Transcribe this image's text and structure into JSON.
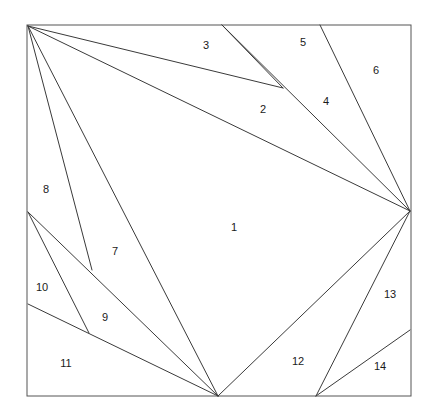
{
  "figure": {
    "background_color": "#ffffff",
    "line_color": "#3a3a3a",
    "border_color": "#555555",
    "label_color": "#1a1a1a",
    "line_width": 1,
    "canvas": {
      "width": 439,
      "height": 420
    }
  },
  "border": {
    "name": "outer-rectangle",
    "x": 27,
    "y": 25,
    "width": 384,
    "height": 371,
    "corners": [
      {
        "name": "top-left",
        "x": 27,
        "y": 25
      },
      {
        "name": "top-right",
        "x": 411,
        "y": 25
      },
      {
        "name": "bottom-right",
        "x": 411,
        "y": 396
      },
      {
        "name": "bottom-left",
        "x": 27,
        "y": 396
      }
    ]
  },
  "vertices": [
    {
      "id": "A",
      "name": "top-left-hub",
      "x": 28,
      "y": 26
    },
    {
      "id": "B",
      "name": "top-edge-node-1",
      "x": 222,
      "y": 25
    },
    {
      "id": "C",
      "name": "top-edge-node-2",
      "x": 320,
      "y": 25
    },
    {
      "id": "D",
      "name": "right-hub",
      "x": 410,
      "y": 211
    },
    {
      "id": "E",
      "name": "interior-node-upper",
      "x": 283,
      "y": 88
    },
    {
      "id": "F",
      "name": "left-edge-node-1",
      "x": 28,
      "y": 212
    },
    {
      "id": "G",
      "name": "left-edge-node-2",
      "x": 28,
      "y": 304
    },
    {
      "id": "H",
      "name": "interior-node-left-upper",
      "x": 92,
      "y": 270
    },
    {
      "id": "I",
      "name": "interior-node-left-lower",
      "x": 89,
      "y": 333
    },
    {
      "id": "J",
      "name": "bottom-hub",
      "x": 218,
      "y": 396
    },
    {
      "id": "K",
      "name": "bottom-edge-node",
      "x": 316,
      "y": 396
    },
    {
      "id": "L",
      "name": "right-edge-node",
      "x": 410,
      "y": 330
    }
  ],
  "segments": [
    {
      "name": "segment-A-to-E",
      "from": "A",
      "to": "E"
    },
    {
      "name": "segment-A-to-D",
      "from": "A",
      "to": "D"
    },
    {
      "name": "segment-A-to-H",
      "from": "A",
      "to": "H"
    },
    {
      "name": "segment-A-to-J",
      "from": "A",
      "to": "J"
    },
    {
      "name": "segment-B-to-E",
      "from": "B",
      "to": "E"
    },
    {
      "name": "segment-B-to-D",
      "from": "B",
      "to": "D"
    },
    {
      "name": "segment-C-to-D",
      "from": "C",
      "to": "D"
    },
    {
      "name": "segment-F-to-I",
      "from": "F",
      "to": "I"
    },
    {
      "name": "segment-F-to-J",
      "from": "F",
      "to": "J"
    },
    {
      "name": "segment-G-to-J",
      "from": "G",
      "to": "J"
    },
    {
      "name": "segment-D-to-J",
      "from": "D",
      "to": "J"
    },
    {
      "name": "segment-D-to-K",
      "from": "D",
      "to": "K"
    },
    {
      "name": "segment-K-to-L",
      "from": "K",
      "to": "L"
    }
  ],
  "labels": [
    {
      "id": "1",
      "text": "1",
      "x": 234,
      "y": 228,
      "region": "central-region"
    },
    {
      "id": "2",
      "text": "2",
      "x": 263,
      "y": 110,
      "region": "region-2"
    },
    {
      "id": "3",
      "text": "3",
      "x": 206,
      "y": 46,
      "region": "region-3"
    },
    {
      "id": "4",
      "text": "4",
      "x": 326,
      "y": 102,
      "region": "region-4"
    },
    {
      "id": "5",
      "text": "5",
      "x": 303,
      "y": 43,
      "region": "region-5"
    },
    {
      "id": "6",
      "text": "6",
      "x": 376,
      "y": 71,
      "region": "region-6"
    },
    {
      "id": "7",
      "text": "7",
      "x": 115,
      "y": 252,
      "region": "region-7"
    },
    {
      "id": "8",
      "text": "8",
      "x": 46,
      "y": 190,
      "region": "region-8"
    },
    {
      "id": "9",
      "text": "9",
      "x": 105,
      "y": 318,
      "region": "region-9"
    },
    {
      "id": "10",
      "text": "10",
      "x": 42,
      "y": 288,
      "region": "region-10"
    },
    {
      "id": "11",
      "text": "11",
      "x": 66,
      "y": 364,
      "region": "region-11"
    },
    {
      "id": "12",
      "text": "12",
      "x": 298,
      "y": 362,
      "region": "region-12"
    },
    {
      "id": "13",
      "text": "13",
      "x": 390,
      "y": 295,
      "region": "region-13"
    },
    {
      "id": "14",
      "text": "14",
      "x": 380,
      "y": 367,
      "region": "region-14"
    }
  ]
}
